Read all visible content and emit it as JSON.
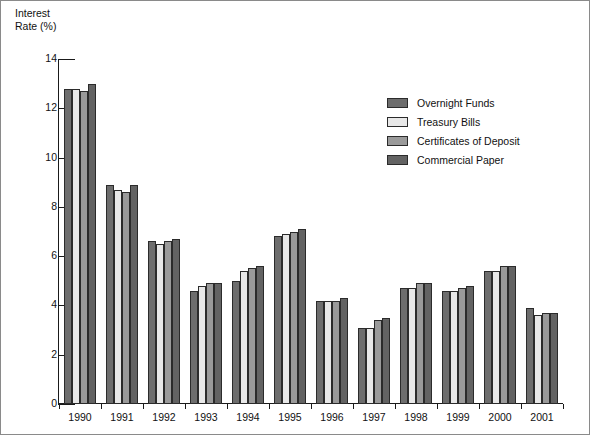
{
  "chart_data": {
    "type": "bar",
    "title": "",
    "subtitle": "",
    "ylabel": "Interest\nRate (%)",
    "xlabel": "",
    "ylim": [
      0,
      14
    ],
    "yticks": [
      0,
      2,
      4,
      6,
      8,
      10,
      12,
      14
    ],
    "ytick_labels": [
      "0",
      "2",
      "4",
      "6",
      "8",
      "10",
      "12",
      "14"
    ],
    "grid": false,
    "legend_position": "upper-right-inside",
    "categories": [
      "1990",
      "1991",
      "1992",
      "1993",
      "1994",
      "1995",
      "1996",
      "1997",
      "1998",
      "1999",
      "2000",
      "2001"
    ],
    "series": [
      {
        "name": "Overnight Funds",
        "color": "#6d6d6d",
        "values": [
          12.8,
          8.9,
          6.6,
          4.6,
          5.0,
          6.8,
          4.2,
          3.1,
          4.7,
          4.6,
          5.4,
          3.9
        ]
      },
      {
        "name": "Treasury Bills",
        "color": "#e8e8e8",
        "values": [
          12.8,
          8.7,
          6.5,
          4.8,
          5.4,
          6.9,
          4.2,
          3.1,
          4.7,
          4.6,
          5.4,
          3.6
        ]
      },
      {
        "name": "Certificates of Deposit",
        "color": "#9a9a9a",
        "values": [
          12.7,
          8.6,
          6.6,
          4.9,
          5.5,
          7.0,
          4.2,
          3.4,
          4.9,
          4.7,
          5.6,
          3.7
        ]
      },
      {
        "name": "Commercial Paper",
        "color": "#636363",
        "values": [
          13.0,
          8.9,
          6.7,
          4.9,
          5.6,
          7.1,
          4.3,
          3.5,
          4.9,
          4.8,
          5.6,
          3.7
        ]
      }
    ]
  },
  "axis": {
    "y_title_text": "Interest\nRate (%)"
  },
  "legend": {
    "items": [
      {
        "label": "Overnight Funds",
        "color": "#6d6d6d"
      },
      {
        "label": "Treasury Bills",
        "color": "#e8e8e8"
      },
      {
        "label": "Certificates of Deposit",
        "color": "#9a9a9a"
      },
      {
        "label": "Commercial Paper",
        "color": "#636363"
      }
    ]
  }
}
